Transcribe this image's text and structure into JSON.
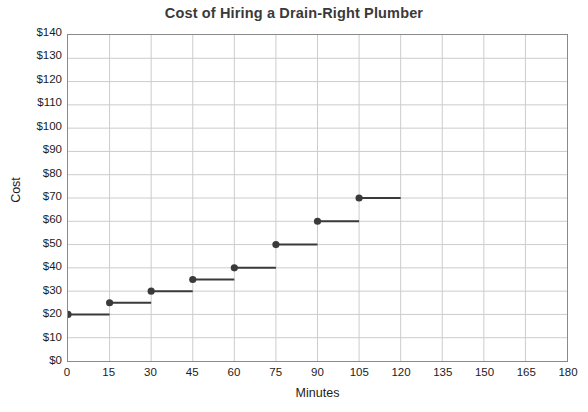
{
  "chart_data": {
    "type": "line",
    "title": "Cost of Hiring a Drain-Right Plumber",
    "xlabel": "Minutes",
    "ylabel": "Cost",
    "grid": true,
    "legend": "none",
    "xlim": [
      0,
      180
    ],
    "ylim": [
      0,
      140
    ],
    "xticks": [
      0,
      15,
      30,
      45,
      60,
      75,
      90,
      105,
      120,
      135,
      150,
      165,
      180
    ],
    "yticks": [
      0,
      10,
      20,
      30,
      40,
      50,
      60,
      70,
      80,
      90,
      100,
      110,
      120,
      130,
      140
    ],
    "xtick_labels": [
      "0",
      "15",
      "30",
      "45",
      "60",
      "75",
      "90",
      "105",
      "120",
      "135",
      "150",
      "165",
      "180"
    ],
    "ytick_labels": [
      "$0",
      "$10",
      "$20",
      "$30",
      "$40",
      "$50",
      "$60",
      "$70",
      "$80",
      "$90",
      "$100",
      "$110",
      "$120",
      "$130",
      "$140"
    ],
    "series": [
      {
        "name": "Cost",
        "style": "step",
        "color": "#3a3a3a",
        "marker": "filled-circle-at-left-endpoint",
        "steps": [
          {
            "x_start": 0,
            "x_end": 15,
            "y": 20
          },
          {
            "x_start": 15,
            "x_end": 30,
            "y": 25
          },
          {
            "x_start": 30,
            "x_end": 45,
            "y": 30
          },
          {
            "x_start": 45,
            "x_end": 60,
            "y": 35
          },
          {
            "x_start": 60,
            "x_end": 75,
            "y": 40
          },
          {
            "x_start": 75,
            "x_end": 90,
            "y": 50
          },
          {
            "x_start": 90,
            "x_end": 105,
            "y": 60
          },
          {
            "x_start": 105,
            "x_end": 120,
            "y": 70
          }
        ],
        "points": [
          {
            "x": 0,
            "y": 20
          },
          {
            "x": 15,
            "y": 25
          },
          {
            "x": 30,
            "y": 30
          },
          {
            "x": 45,
            "y": 35
          },
          {
            "x": 60,
            "y": 40
          },
          {
            "x": 75,
            "y": 50
          },
          {
            "x": 90,
            "y": 60
          },
          {
            "x": 105,
            "y": 70
          }
        ]
      }
    ]
  },
  "colors": {
    "title": "#3a3a3a",
    "axis": "#8a8a8a",
    "grid": "#cccccc",
    "series": "#3a3a3a",
    "background": "#ffffff",
    "text": "#1c1c1c"
  }
}
